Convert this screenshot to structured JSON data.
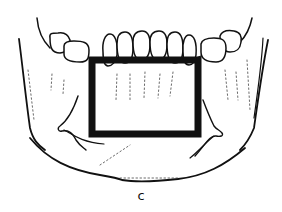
{
  "figure": {
    "label": "c",
    "colors": {
      "line": "#111111",
      "background": "#ffffff"
    }
  }
}
